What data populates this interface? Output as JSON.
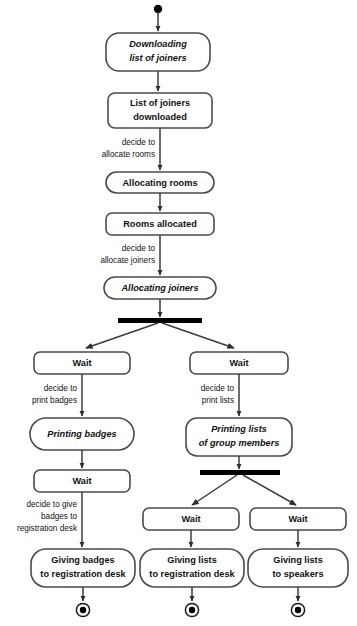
{
  "diagram": {
    "type": "uml-activity-diagram",
    "background_color": "#ffffff",
    "stroke_color": "#4a4a4a",
    "text_color": "#111111",
    "bar_color": "#000000",
    "initial_node": {
      "name": "initial-node",
      "shape": "filled-circle"
    },
    "nodes": {
      "downloading_list_of_joiners": {
        "line1": "Downloading",
        "line2": "list of joiners",
        "style": "rounded-rect",
        "italic": true
      },
      "list_of_joiners_downloaded": {
        "line1": "List of joiners",
        "line2": "downloaded",
        "style": "rounded-rect",
        "italic": false
      },
      "allocating_rooms": {
        "line1": "Allocating rooms",
        "style": "pill",
        "italic": false
      },
      "rooms_allocated": {
        "line1": "Rooms allocated",
        "style": "rounded-rect",
        "italic": false
      },
      "allocating_joiners": {
        "line1": "Allocating joiners",
        "style": "pill",
        "italic": true
      },
      "wait_left_top": {
        "line1": "Wait",
        "style": "rounded-rect",
        "italic": false
      },
      "wait_right_top": {
        "line1": "Wait",
        "style": "rounded-rect",
        "italic": false
      },
      "printing_badges": {
        "line1": "Printing badges",
        "style": "pill",
        "italic": true
      },
      "printing_lists_of_group_members": {
        "line1": "Printing lists",
        "line2": "of group members",
        "style": "rounded-rect",
        "italic": true
      },
      "wait_left_mid": {
        "line1": "Wait",
        "style": "rounded-rect",
        "italic": false
      },
      "wait_center_low": {
        "line1": "Wait",
        "style": "rounded-rect",
        "italic": false
      },
      "wait_right_low": {
        "line1": "Wait",
        "style": "rounded-rect",
        "italic": false
      },
      "giving_badges_to_registration_desk": {
        "line1": "Giving badges",
        "line2": "to registration desk",
        "style": "pill",
        "italic": false
      },
      "giving_lists_to_registration_desk": {
        "line1": "Giving lists",
        "line2": "to registration desk",
        "style": "pill",
        "italic": false
      },
      "giving_lists_to_speakers": {
        "line1": "Giving lists",
        "line2": "to speakers",
        "style": "pill",
        "italic": false
      }
    },
    "guards": {
      "allocate_rooms": {
        "line1": "decide to",
        "line2": "allocate rooms"
      },
      "allocate_joiners": {
        "line1": "decide to",
        "line2": "allocate joiners"
      },
      "print_badges": {
        "line1": "decide to",
        "line2": "print badges"
      },
      "print_lists": {
        "line1": "decide to",
        "line2": "print lists"
      },
      "give_badges": {
        "line1": "decide to give",
        "line2": "badges to",
        "line3": "registration desk"
      }
    },
    "fork_bars": [
      {
        "name": "fork-bar-top"
      },
      {
        "name": "fork-bar-lower"
      }
    ],
    "final_nodes": [
      {
        "name": "final-node-badges"
      },
      {
        "name": "final-node-lists-registration"
      },
      {
        "name": "final-node-lists-speakers"
      }
    ]
  }
}
